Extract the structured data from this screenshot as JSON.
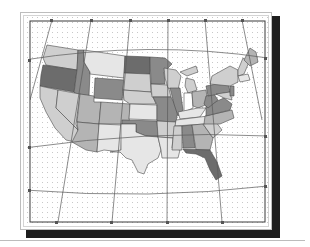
{
  "figure": {
    "type": "choropleth-map",
    "projection": "conic (curved parallels, converging meridians)",
    "tick_labels_legible": false,
    "colors": {
      "frame": "#3a3a3a",
      "grid_dot": "#c8c8c8",
      "graticule": "#5a5a5a",
      "shadow": "#1e1e1e",
      "state_border": "#4a4a4a",
      "shade_light": "#e6e6e6",
      "shade_lightmid": "#cfcfcf",
      "shade_mid": "#b4b4b4",
      "shade_dark": "#8a8a8a",
      "shade_darkest": "#6c6c6c"
    },
    "shading_classes": [
      {
        "class": "light",
        "hex": "#e6e6e6"
      },
      {
        "class": "light-mid",
        "hex": "#cfcfcf"
      },
      {
        "class": "mid",
        "hex": "#b4b4b4"
      },
      {
        "class": "dark",
        "hex": "#8a8a8a"
      },
      {
        "class": "darkest",
        "hex": "#6c6c6c"
      }
    ]
  }
}
